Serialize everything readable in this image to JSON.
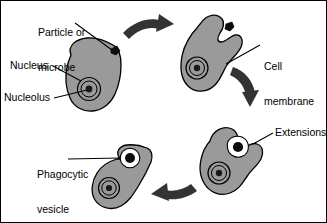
{
  "figure": {
    "background_color": "#ffffff",
    "border_color": "#000000",
    "cytoplasm_color": "#9a9a9a",
    "outline_color": "#000000",
    "particle_color": "#000000",
    "vesicle_color": "#ffffff",
    "arrow_color": "#333333"
  },
  "labels": {
    "particle": {
      "line1": "Particle or",
      "line2": "microbe"
    },
    "nucleus": "Nucleus",
    "nucleolus": "Nucleolus",
    "cell_membrane": {
      "line1": "Cell",
      "line2": "membrane"
    },
    "extensions": "Extensions",
    "phagocytic_vesicle": {
      "line1": "Phagocytic",
      "line2": "vesicle"
    }
  },
  "stages": [
    {
      "id": "stage-1",
      "name": "cell-with-free-particle",
      "description": "Amoeboid cell with nucleus and nucleolus; particle or microbe free outside the cell",
      "has_particle_inside": false
    },
    {
      "id": "stage-2",
      "name": "cell-contacting-particle",
      "description": "Cell membrane indents toward the particle at the cell surface",
      "has_particle_inside": false
    },
    {
      "id": "stage-3",
      "name": "cell-forming-extensions",
      "description": "Pseudopod extensions surround the particle forming a cup",
      "has_particle_inside": true
    },
    {
      "id": "stage-4",
      "name": "cell-with-phagocytic-vesicle",
      "description": "Particle fully internalized within a phagocytic vesicle",
      "has_particle_inside": true
    }
  ],
  "arrows": [
    {
      "id": "arrow-1",
      "name": "arrow-stage1-to-stage2",
      "direction": "right"
    },
    {
      "id": "arrow-2",
      "name": "arrow-stage2-to-stage3",
      "direction": "down"
    },
    {
      "id": "arrow-3",
      "name": "arrow-stage3-to-stage4",
      "direction": "left"
    }
  ]
}
